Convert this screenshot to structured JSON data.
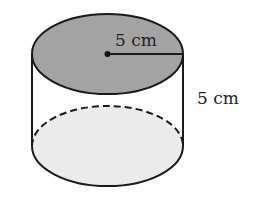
{
  "diagram": {
    "type": "cylinder",
    "radius_label": "5 cm",
    "height_label": "5 cm",
    "colors": {
      "top_face": "#a3a3a3",
      "bottom_face": "#ebebeb",
      "stroke": "#1a1a1a",
      "text": "#222222"
    }
  }
}
